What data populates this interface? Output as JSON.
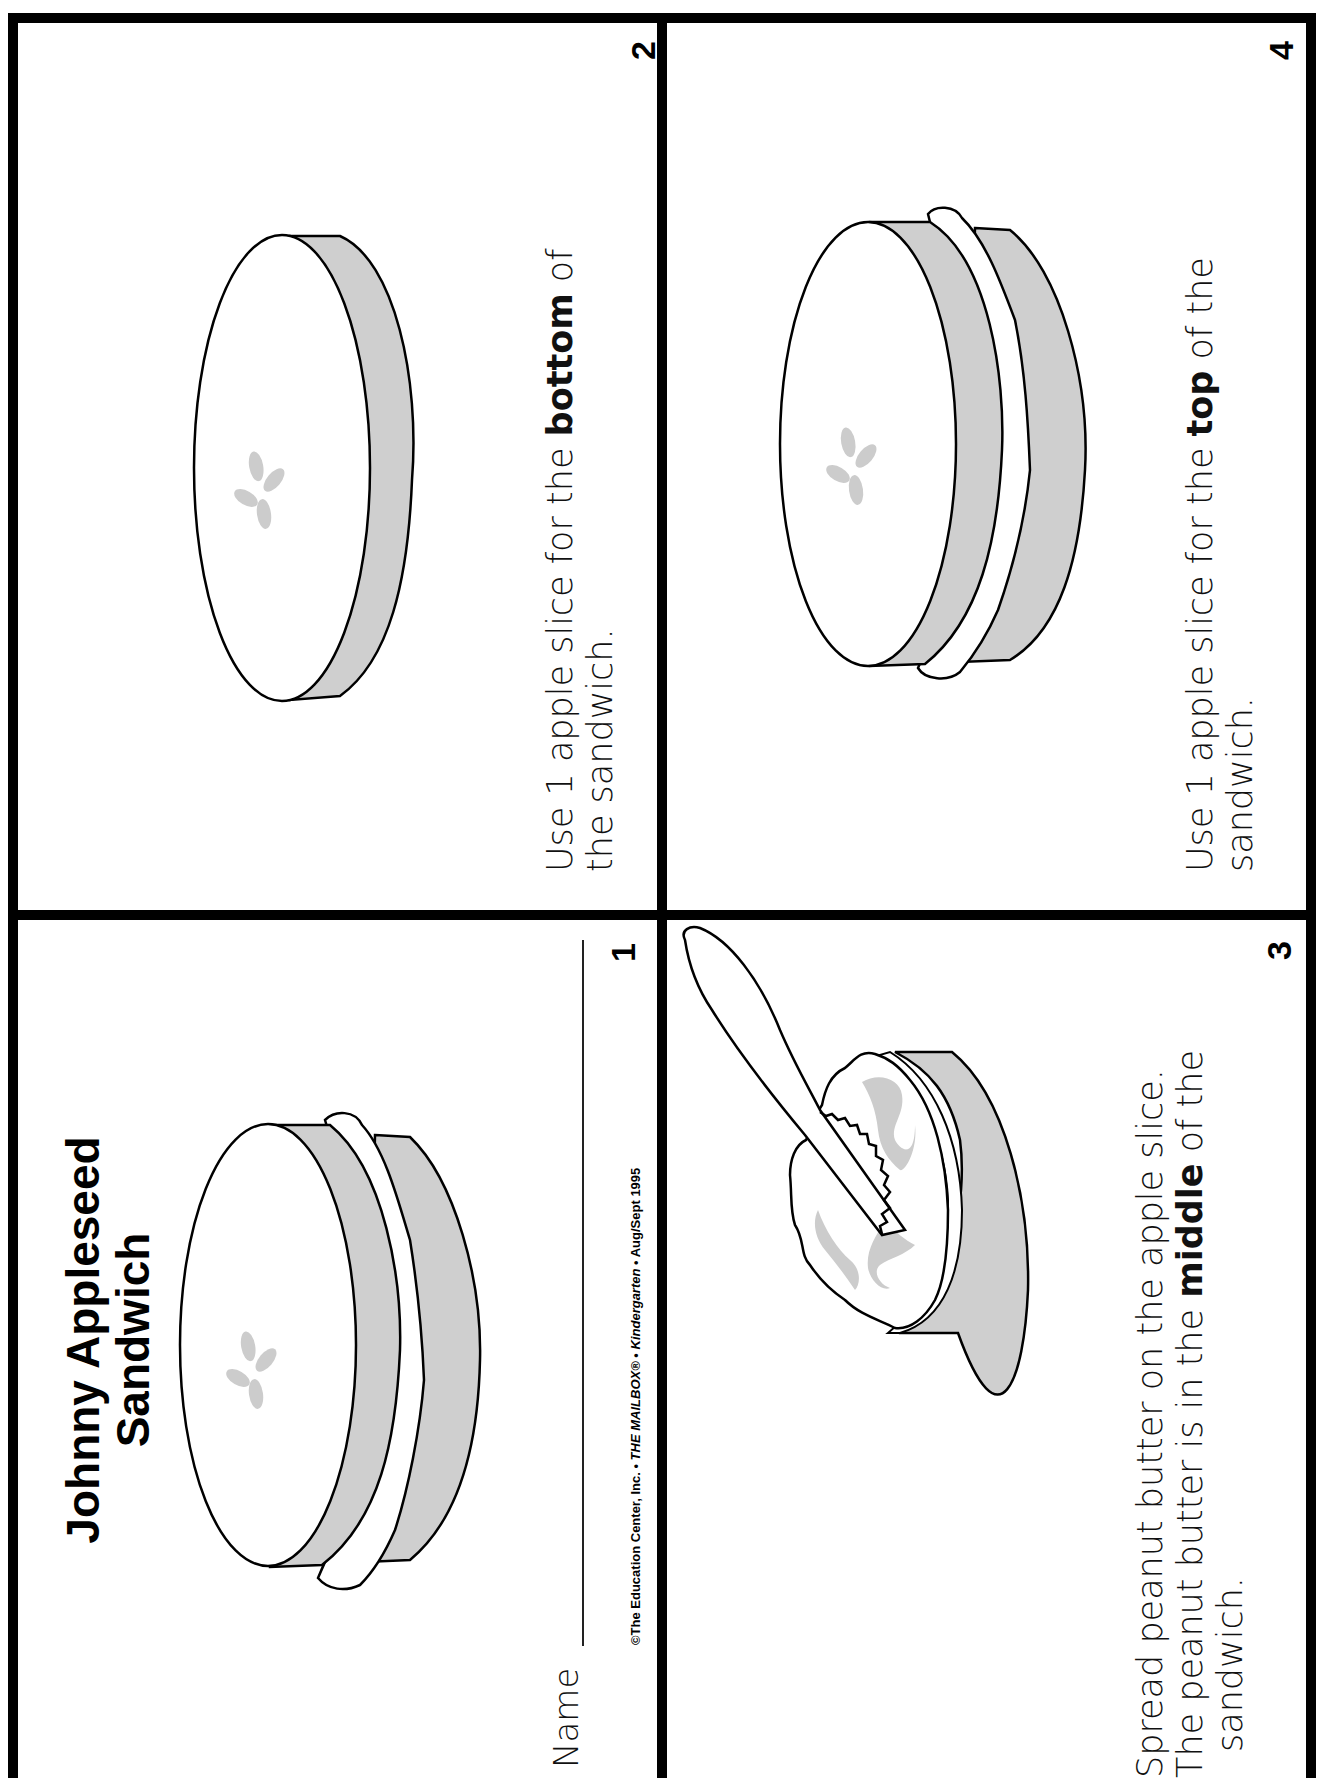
{
  "worksheet": {
    "title_line1": "Johnny Appleseed",
    "title_line2": "Sandwich",
    "name_label": "Name",
    "copyright": {
      "prefix": "©The Education Center, Inc. • ",
      "magazine": "THE MAILBOX®",
      "sep1": " • ",
      "edition": "Kindergarten",
      "suffix": " • Aug/Sept 1995"
    },
    "colors": {
      "border": "#000000",
      "rind_gray": "#cfcfcf",
      "seed_gray": "#cccccc",
      "background": "#ffffff"
    }
  },
  "panels": [
    {
      "number": "1",
      "illustration": "assembled-apple-sandwich"
    },
    {
      "number": "2",
      "illustration": "single-apple-slice",
      "text": {
        "line1_pre": "Use 1 apple slice for the ",
        "line1_bold": "bottom",
        "line1_post": " of",
        "line2": "the sandwich."
      }
    },
    {
      "number": "3",
      "illustration": "knife-spreading-peanut-butter",
      "text": {
        "line1": "Spread peanut butter on the apple slice.",
        "line2_pre": "The peanut butter is in the ",
        "line2_bold": "middle",
        "line2_post": " of the",
        "line3": "sandwich."
      }
    },
    {
      "number": "4",
      "illustration": "assembled-apple-sandwich",
      "text": {
        "line1_pre": "Use 1 apple slice for the ",
        "line1_bold": "top",
        "line1_post": " of the",
        "line2": "sandwich."
      }
    }
  ]
}
